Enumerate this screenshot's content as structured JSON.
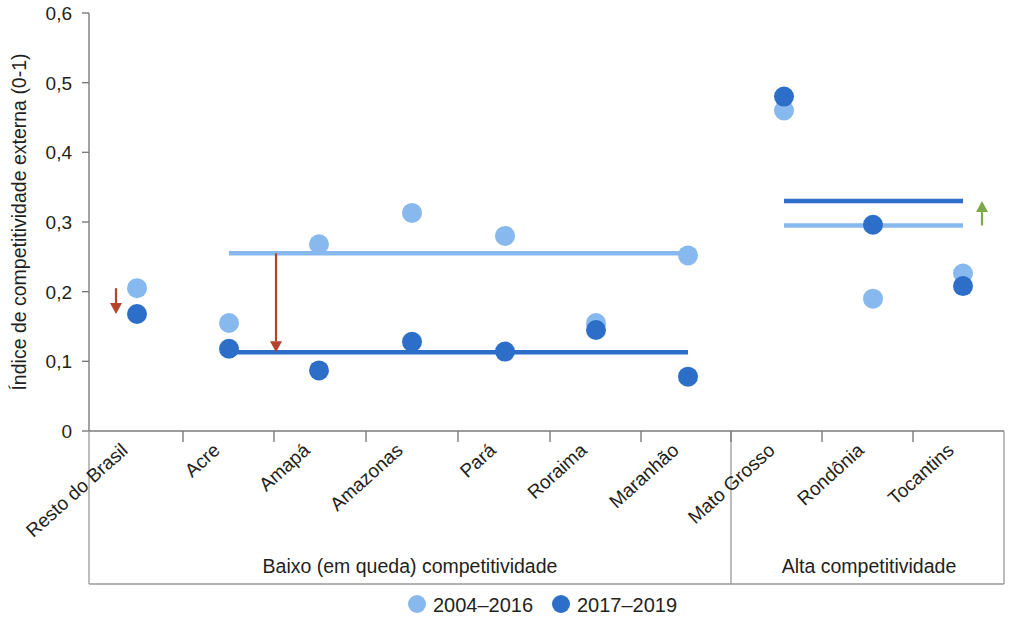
{
  "chart_data": {
    "type": "scatter",
    "title": "",
    "xlabel": "",
    "ylabel": "Índice de competitividade externa (0-1)",
    "ylim": [
      0,
      0.6
    ],
    "yticks": [
      0,
      0.1,
      0.2,
      0.3,
      0.4,
      0.5,
      0.6
    ],
    "ytick_labels": [
      "0",
      "0,1",
      "0,2",
      "0,3",
      "0,4",
      "0,5",
      "0,6"
    ],
    "grid": false,
    "legend_position": "bottom",
    "categories": [
      "Resto do Brasil",
      "Acre",
      "Amapá",
      "Amazonas",
      "Pará",
      "Roraima",
      "Maranhão",
      "Mato Grosso",
      "Rondônia",
      "Tocantins"
    ],
    "series": [
      {
        "name": "2004–2016",
        "color": "#88B9EE",
        "values": [
          0.205,
          0.155,
          0.268,
          0.313,
          0.28,
          0.155,
          0.252,
          0.46,
          0.19,
          0.226
        ]
      },
      {
        "name": "2017–2019",
        "color": "#2D6FC8",
        "values": [
          0.168,
          0.118,
          0.087,
          0.128,
          0.114,
          0.145,
          0.078,
          0.48,
          0.296,
          0.208
        ]
      }
    ],
    "reference_lines": [
      {
        "name": "low-group-mean-2004-2016",
        "group": "Baixo (em queda) competitividade",
        "series": "2004–2016",
        "value": 0.255,
        "from_category": "Acre",
        "to_category": "Maranhão",
        "color": "#88B9EE"
      },
      {
        "name": "low-group-mean-2017-2019",
        "group": "Baixo (em queda) competitividade",
        "series": "2017–2019",
        "value": 0.113,
        "from_category": "Acre",
        "to_category": "Maranhão",
        "color": "#2D6FC8"
      },
      {
        "name": "high-group-mean-2004-2016",
        "group": "Alta competitividade",
        "series": "2004–2016",
        "value": 0.295,
        "from_category": "Mato Grosso",
        "to_category": "Tocantins",
        "color": "#88B9EE"
      },
      {
        "name": "high-group-mean-2017-2019",
        "group": "Alta competitividade",
        "series": "2017–2019",
        "value": 0.33,
        "from_category": "Mato Grosso",
        "to_category": "Tocantins",
        "color": "#2D6FC8"
      }
    ],
    "annotations": [
      {
        "name": "decline-arrow-resto-do-brasil",
        "direction": "down",
        "color": "#B5432B",
        "from_value": 0.205,
        "to_value": 0.168,
        "at_category": "Resto do Brasil"
      },
      {
        "name": "decline-arrow-low-group",
        "direction": "down",
        "color": "#B5432B",
        "from_value": 0.255,
        "to_value": 0.113,
        "at_category": "Amapá"
      },
      {
        "name": "rise-arrow-high-group",
        "direction": "up",
        "color": "#7CA84A",
        "from_value": 0.295,
        "to_value": 0.33,
        "at_category": "Tocantins"
      }
    ],
    "groups": [
      {
        "label": "Baixo (em queda) competitividade",
        "categories": [
          "Resto do Brasil",
          "Acre",
          "Amapá",
          "Amazonas",
          "Pará",
          "Roraima",
          "Maranhão"
        ]
      },
      {
        "label": "Alta competitividade",
        "categories": [
          "Mato Grosso",
          "Rondônia",
          "Tocantins"
        ]
      }
    ]
  },
  "legend": {
    "items": [
      {
        "label": "2004–2016",
        "color": "#88B9EE"
      },
      {
        "label": "2017–2019",
        "color": "#2D6FC8"
      }
    ]
  },
  "axis": {
    "y_title": "Índice de competitividade externa (0-1)"
  },
  "groups": {
    "left_label": "Baixo (em queda) competitividade",
    "right_label": "Alta competitividade"
  }
}
